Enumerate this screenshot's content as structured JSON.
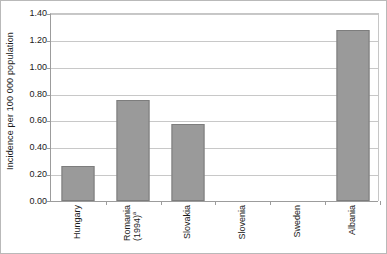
{
  "chart_data": {
    "type": "bar",
    "title": "",
    "subtitle": "",
    "xlabel": "",
    "ylabel": "Incidence per 100 000 population",
    "ylim": [
      0.0,
      1.4
    ],
    "ytick_step": 0.2,
    "ytick_labels": [
      "1.40",
      "1.20",
      "1.00",
      "0.80",
      "0.60",
      "0.40",
      "0.20",
      "0.00"
    ],
    "ytick_values": [
      1.4,
      1.2,
      1.0,
      0.8,
      0.6,
      0.4,
      0.2,
      0.0
    ],
    "grid": "horizontal",
    "legend": "none",
    "categories": [
      "Hungary",
      "Romania (1994)a",
      "Slovakia",
      "Slovenia",
      "Sweden",
      "Albania"
    ],
    "category_labels": [
      {
        "line1": "Hungary",
        "line2": "",
        "footnote": ""
      },
      {
        "line1": "Romania",
        "line2": "(1994)",
        "footnote": "a"
      },
      {
        "line1": "Slovakia",
        "line2": "",
        "footnote": ""
      },
      {
        "line1": "Slovenia",
        "line2": "",
        "footnote": ""
      },
      {
        "line1": "Sweden",
        "line2": "",
        "footnote": ""
      },
      {
        "line1": "Albania",
        "line2": "",
        "footnote": ""
      }
    ],
    "values": [
      0.26,
      0.75,
      0.57,
      0.0,
      0.0,
      1.27
    ],
    "series": [
      {
        "name": "Incidence per 100 000 population",
        "values": [
          0.26,
          0.75,
          0.57,
          0.0,
          0.0,
          1.27
        ],
        "color": "#9a9a9a"
      }
    ],
    "colors": {
      "bar_fill": "#9a9a9a",
      "bar_border": "#7d7d7d",
      "gridline": "#c8c8c8",
      "axis": "#9c9c9c",
      "text": "#1a1a1a",
      "plot_background": "#ffffff",
      "figure_border": "#b9b9b9"
    }
  }
}
